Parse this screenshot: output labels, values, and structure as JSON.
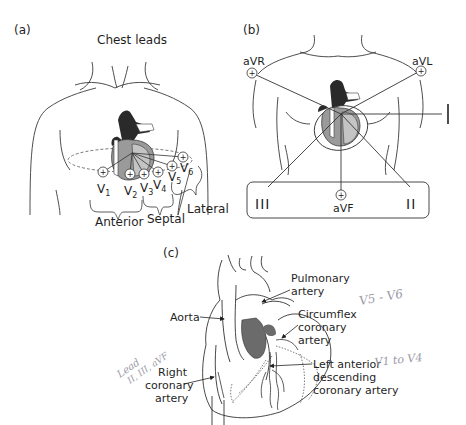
{
  "panels": {
    "a": {
      "tag": "(a)",
      "title": "Chest leads",
      "leads": [
        "V1",
        "V2",
        "V3",
        "V4",
        "V5",
        "V6"
      ],
      "lead_labels": [
        {
          "main": "V",
          "sub": "1"
        },
        {
          "main": "V",
          "sub": "2"
        },
        {
          "main": "V",
          "sub": "3"
        },
        {
          "main": "V",
          "sub": "4"
        },
        {
          "main": "V",
          "sub": "5"
        },
        {
          "main": "V",
          "sub": "6"
        }
      ],
      "groups": [
        "Anterior",
        "Septal",
        "Lateral"
      ]
    },
    "b": {
      "tag": "(b)",
      "limb_leads": {
        "aVR": "aVR",
        "aVL": "aVL",
        "I": "I",
        "II": "II",
        "III": "III",
        "aVF": "aVF"
      }
    },
    "c": {
      "tag": "(c)",
      "labels": {
        "pulmonary_1": "Pulmonary",
        "pulmonary_2": "artery",
        "aorta": "Aorta",
        "circumflex_1": "Circumflex",
        "circumflex_2": "coronary",
        "circumflex_3": "artery",
        "lad_1": "Left anterior",
        "lad_2": "descending",
        "lad_3": "coronary artery",
        "rca_1": "Right",
        "rca_2": "coronary",
        "rca_3": "artery"
      },
      "handwritten": {
        "note_lead_1": "Lead",
        "note_lead_2": "II, III, aVF",
        "note_v5v6": "V5 - V6",
        "note_v1v4": "V1 to V4"
      }
    }
  },
  "colors": {
    "line": "#3a3a3a",
    "heart_dark": "#2a2a2a",
    "heart_mid": "#9a9a9a",
    "heart_light": "#c4c4c4",
    "handwriting": "#9a9aa8"
  }
}
